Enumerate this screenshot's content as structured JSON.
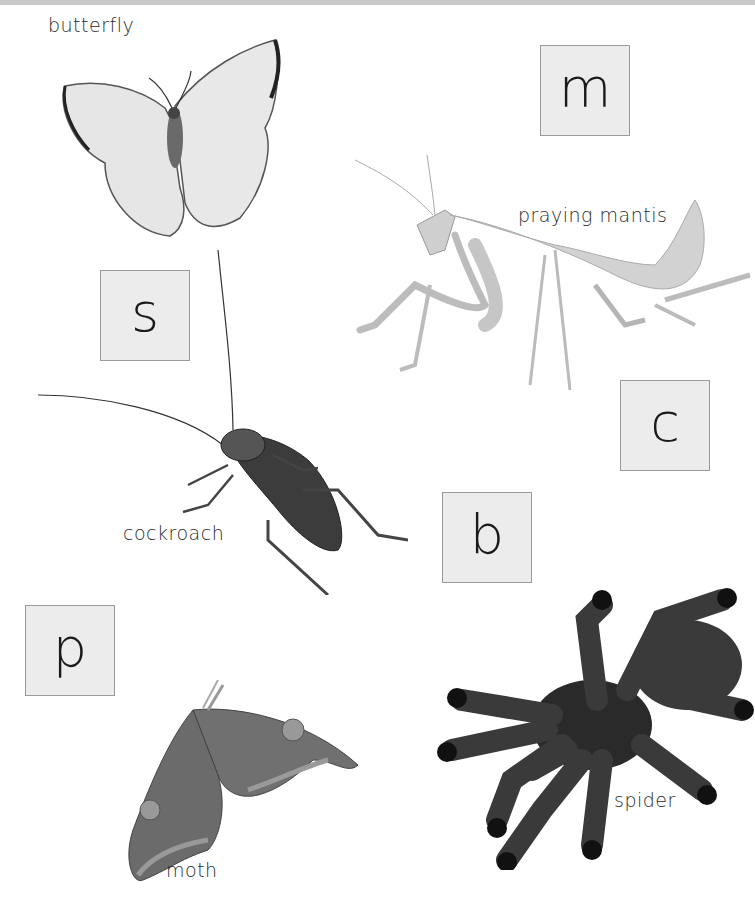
{
  "page": {
    "background": "#ffffff",
    "top_bar_color": "#c9c9c9"
  },
  "letter_boxes": [
    {
      "letter": "m"
    },
    {
      "letter": "s"
    },
    {
      "letter": "c"
    },
    {
      "letter": "b"
    },
    {
      "letter": "p"
    }
  ],
  "creatures": [
    {
      "name": "butterfly",
      "label": "butterfly",
      "image": "butterfly-photo"
    },
    {
      "name": "praying-mantis",
      "label": "praying mantis",
      "image": "praying-mantis-photo"
    },
    {
      "name": "cockroach",
      "label": "cockroach",
      "image": "cockroach-photo"
    },
    {
      "name": "moth",
      "label": "moth",
      "image": "moth-photo"
    },
    {
      "name": "spider",
      "label": "spider",
      "image": "spider-photo"
    }
  ]
}
